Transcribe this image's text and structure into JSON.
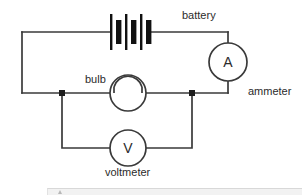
{
  "figure": {
    "background_color": "#ffffff",
    "line_color": "#3a3a3a",
    "text_color": "#2b2b2b"
  },
  "labels": {
    "battery": "battery",
    "ammeter": "ammeter",
    "bulb": "bulb",
    "voltmeter": "voltmeter"
  },
  "meters": {
    "ammeter_symbol": "A",
    "voltmeter_symbol": "V"
  },
  "components": [
    {
      "name": "battery",
      "symbol": "battery-cells",
      "label": "battery",
      "cells": 3,
      "center_x": 128,
      "center_y": 32
    },
    {
      "name": "ammeter",
      "symbol": "circle-with-letter",
      "letter": "A",
      "label": "ammeter",
      "center_x": 228,
      "center_y": 62,
      "radius": 19
    },
    {
      "name": "bulb",
      "symbol": "circle-with-dome-arc",
      "label": "bulb",
      "center_x": 128,
      "center_y": 93,
      "radius": 18
    },
    {
      "name": "voltmeter",
      "symbol": "circle-with-letter",
      "letter": "V",
      "label": "voltmeter",
      "center_x": 128,
      "center_y": 148,
      "radius": 18
    }
  ],
  "junctions": [
    {
      "name": "left-junction",
      "x": 62,
      "y": 93
    },
    {
      "name": "right-junction",
      "x": 192,
      "y": 93
    }
  ],
  "bottom_bar": {
    "visible": true,
    "color": "#f2f2f2"
  }
}
